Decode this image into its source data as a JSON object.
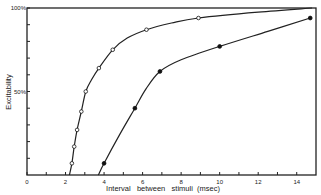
{
  "chart_data": {
    "type": "line",
    "title": "",
    "xlabel": "Interval   between   stimuli  (msec)",
    "ylabel": "Excitability",
    "xlim": [
      0,
      15
    ],
    "ylim": [
      0,
      100
    ],
    "x_ticks": [
      0,
      1,
      2,
      3,
      4,
      5,
      6,
      7,
      8,
      9,
      10,
      11,
      12,
      13,
      14
    ],
    "x_tick_labels": [
      {
        "value": 0,
        "label": "0"
      },
      {
        "value": 2,
        "label": "2"
      },
      {
        "value": 4,
        "label": "4"
      },
      {
        "value": 6,
        "label": "6"
      },
      {
        "value": 8,
        "label": "8"
      },
      {
        "value": 10,
        "label": "10"
      },
      {
        "value": 12,
        "label": "12"
      },
      {
        "value": 14,
        "label": "14"
      }
    ],
    "y_ticks": [
      10,
      20,
      30,
      40,
      50,
      60,
      70,
      80,
      90,
      100
    ],
    "y_tick_labels": [
      {
        "value": 50,
        "label": "50%"
      },
      {
        "value": 100,
        "label": "100%"
      }
    ],
    "grid": false,
    "series": [
      {
        "name": "open-circles",
        "marker": "open-circle",
        "points": [
          {
            "x": 2.33,
            "y": 7
          },
          {
            "x": 2.45,
            "y": 17
          },
          {
            "x": 2.6,
            "y": 27
          },
          {
            "x": 2.82,
            "y": 38
          },
          {
            "x": 3.05,
            "y": 50
          },
          {
            "x": 3.73,
            "y": 64
          },
          {
            "x": 4.45,
            "y": 75
          },
          {
            "x": 6.2,
            "y": 87
          },
          {
            "x": 8.9,
            "y": 94
          }
        ],
        "curve": [
          {
            "x": 2.2,
            "y": 0
          },
          {
            "x": 2.33,
            "y": 7
          },
          {
            "x": 2.45,
            "y": 17
          },
          {
            "x": 2.6,
            "y": 27
          },
          {
            "x": 2.82,
            "y": 38
          },
          {
            "x": 3.05,
            "y": 50
          },
          {
            "x": 3.35,
            "y": 57
          },
          {
            "x": 3.73,
            "y": 64
          },
          {
            "x": 4.45,
            "y": 75
          },
          {
            "x": 5.2,
            "y": 82
          },
          {
            "x": 6.2,
            "y": 87
          },
          {
            "x": 7.5,
            "y": 91
          },
          {
            "x": 8.9,
            "y": 94
          },
          {
            "x": 12,
            "y": 97.5
          },
          {
            "x": 14.8,
            "y": 100
          }
        ]
      },
      {
        "name": "filled-circles",
        "marker": "filled-circle",
        "points": [
          {
            "x": 4.0,
            "y": 7
          },
          {
            "x": 5.6,
            "y": 40
          },
          {
            "x": 6.9,
            "y": 62
          },
          {
            "x": 10.0,
            "y": 77
          },
          {
            "x": 14.7,
            "y": 94
          }
        ],
        "curve": [
          {
            "x": 3.7,
            "y": 0
          },
          {
            "x": 4.0,
            "y": 7
          },
          {
            "x": 4.8,
            "y": 24
          },
          {
            "x": 5.6,
            "y": 40
          },
          {
            "x": 6.2,
            "y": 52
          },
          {
            "x": 6.9,
            "y": 62
          },
          {
            "x": 8.0,
            "y": 69
          },
          {
            "x": 10.0,
            "y": 77
          },
          {
            "x": 12.5,
            "y": 86
          },
          {
            "x": 14.7,
            "y": 94
          }
        ]
      }
    ]
  }
}
